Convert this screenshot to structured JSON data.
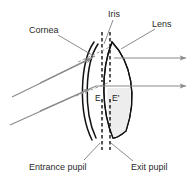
{
  "figure": {
    "type": "optical-schematic-diagram",
    "background_color": "#ffffff"
  },
  "colors": {
    "ink": "#111111",
    "label_text": "#2b2b2b",
    "ray": "#8a8a8a",
    "leader": "#6e6e6e",
    "lens_fill": "#efefef",
    "background": "#ffffff"
  },
  "labels": {
    "cornea": "Cornea",
    "iris": "Iris",
    "lens": "Lens",
    "entrance_pupil": "Entrance pupil",
    "exit_pupil": "Exit pupil",
    "point_e": "E",
    "point_e_prime": "E'"
  },
  "elements": {
    "cornea": {
      "name": "cornea",
      "description": "double curved arc on the left, concave toward the right"
    },
    "iris": {
      "name": "iris",
      "description": "two vertical dashed lines with a central gap forming the pupil aperture"
    },
    "lens": {
      "name": "crystalline-lens",
      "description": "biconvex lens shape shaded light gray in its lower half"
    },
    "rays": {
      "count": 4,
      "incoming": 2,
      "outgoing": 2,
      "description": "two gray rays entering from the left at an upward slope and two horizontal gray rays exiting to the right, each terminated with an arrowhead"
    }
  }
}
